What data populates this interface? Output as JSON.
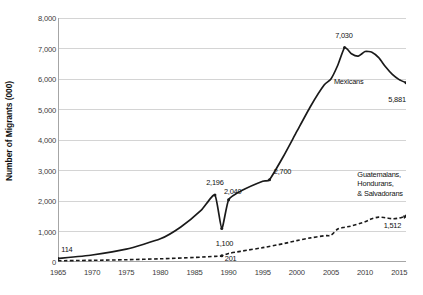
{
  "chart_data": {
    "type": "line",
    "title": "",
    "xlabel": "",
    "ylabel": "Number of Migrants (000)",
    "xlim": [
      1965,
      2016
    ],
    "ylim": [
      0,
      8000
    ],
    "ytick_labels": [
      "8,000",
      "7,000",
      "6,000",
      "5,000",
      "4,000",
      "3,000",
      "2,000",
      "1,000",
      "0"
    ],
    "ytick_values": [
      8000,
      7000,
      6000,
      5000,
      4000,
      3000,
      2000,
      1000,
      0
    ],
    "xtick_labels": [
      "1965",
      "1970",
      "1975",
      "1980",
      "1985",
      "1990",
      "1995",
      "2000",
      "2005",
      "2010",
      "2015"
    ],
    "xtick_values": [
      1965,
      1970,
      1975,
      1980,
      1985,
      1990,
      1995,
      2000,
      2005,
      2010,
      2015
    ],
    "grid": "horizontal",
    "legend_position": "inline-annotations",
    "series": [
      {
        "name": "Mexicans",
        "style": "solid",
        "color": "#1a1a1a",
        "x": [
          1965,
          1970,
          1975,
          1980,
          1983,
          1986,
          1988,
          1989,
          1990,
          1992,
          1995,
          1996,
          1998,
          2000,
          2002,
          2004,
          2005,
          2006,
          2007,
          2008,
          2009,
          2010,
          2011,
          2012,
          2013,
          2014,
          2015,
          2016
        ],
        "values": [
          114,
          230,
          420,
          760,
          1150,
          1700,
          2196,
          1100,
          2040,
          2350,
          2650,
          2700,
          3450,
          4280,
          5100,
          5800,
          6000,
          6450,
          7030,
          6830,
          6750,
          6900,
          6880,
          6700,
          6400,
          6150,
          5980,
          5881
        ]
      },
      {
        "name": "Guatemalans, Hondurans, & Salvadorans",
        "style": "dashed",
        "color": "#1a1a1a",
        "x": [
          1965,
          1970,
          1975,
          1980,
          1985,
          1988,
          1989,
          1990,
          1992,
          1995,
          1998,
          2000,
          2002,
          2004,
          2005,
          2006,
          2007,
          2008,
          2010,
          2011,
          2012,
          2013,
          2014,
          2015,
          2016
        ],
        "values": [
          40,
          55,
          75,
          105,
          150,
          185,
          201,
          280,
          360,
          470,
          600,
          700,
          790,
          860,
          880,
          1080,
          1140,
          1180,
          1320,
          1420,
          1470,
          1450,
          1420,
          1440,
          1512
        ]
      }
    ],
    "data_labels": [
      {
        "text": "114",
        "series": "Mexicans",
        "x": 1965,
        "value": 114,
        "lx": 1966.3,
        "ly": 430
      },
      {
        "text": "2,196",
        "series": "Mexicans",
        "x": 1988,
        "value": 2196,
        "lx": 1988.0,
        "ly": 2620
      },
      {
        "text": "1,100",
        "series": "Mexicans",
        "x": 1989,
        "value": 1100,
        "lx": 1989.4,
        "ly": 640
      },
      {
        "text": "2,040",
        "series": "Mexicans",
        "x": 1990,
        "value": 2040,
        "lx": 1990.6,
        "ly": 2330
      },
      {
        "text": "2,700",
        "series": "Mexicans",
        "x": 1996,
        "value": 2700,
        "lx": 1997.9,
        "ly": 2980
      },
      {
        "text": "7,030",
        "series": "Mexicans",
        "x": 2007,
        "value": 7030,
        "lx": 2006.9,
        "ly": 7460
      },
      {
        "text": "5,881",
        "series": "Mexicans",
        "x": 2016,
        "value": 5881,
        "lx": 2014.7,
        "ly": 5360
      },
      {
        "text": "201",
        "series": "Guatemalans, Hondurans, & Salvadorans",
        "x": 1989,
        "value": 201,
        "lx": 1990.3,
        "ly": 140
      },
      {
        "text": "1,512",
        "series": "Guatemalans, Hondurans, & Salvadorans",
        "x": 2016,
        "value": 1512,
        "lx": 2014.0,
        "ly": 1200
      }
    ],
    "series_labels": [
      {
        "text": "Mexicans",
        "lx": 2007.6,
        "ly": 5900
      },
      {
        "text": "Guatemalans,\nHondurans,\n& Salvadorans",
        "lx": 2012.2,
        "ly": 2560
      }
    ],
    "colors": {
      "line": "#1a1a1a",
      "grid": "#d4d4d4",
      "axis": "#a6a6a6",
      "text": "#1a1a1a",
      "tick_text": "#3a3a3a",
      "background": "#ffffff"
    }
  }
}
